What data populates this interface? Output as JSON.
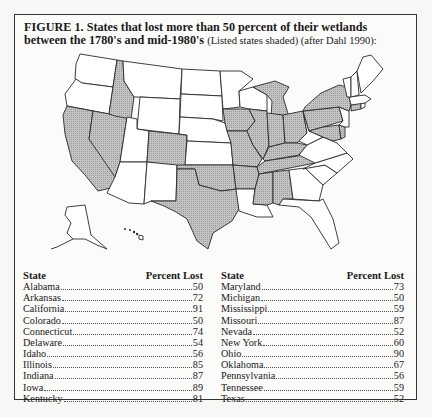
{
  "figure": {
    "caption_bold": "FIGURE 1. States that lost more than 50 percent of their wetlands between the 1780's and mid-1980's",
    "caption_note": "(Listed states shaded) (after Dahl 1990):"
  },
  "map": {
    "shade_color": "#b8b8b8",
    "shaded_states": [
      "Alabama",
      "Arkansas",
      "California",
      "Colorado",
      "Connecticut",
      "Delaware",
      "Idaho",
      "Illinois",
      "Indiana",
      "Iowa",
      "Kentucky",
      "Maryland",
      "Michigan",
      "Mississippi",
      "Missouri",
      "Nevada",
      "New York",
      "Ohio",
      "Oklahoma",
      "Pennsylvania",
      "Tennessee",
      "Texas"
    ]
  },
  "table": {
    "headers": {
      "state": "State",
      "percent": "Percent Lost"
    },
    "left": [
      {
        "state": "Alabama",
        "percent": "50"
      },
      {
        "state": "Arkansas",
        "percent": "72"
      },
      {
        "state": "California",
        "percent": "91"
      },
      {
        "state": "Colorado",
        "percent": "50"
      },
      {
        "state": "Connecticut",
        "percent": "74"
      },
      {
        "state": "Delaware",
        "percent": "54"
      },
      {
        "state": "Idaho",
        "percent": "56"
      },
      {
        "state": "Illinois",
        "percent": "85"
      },
      {
        "state": "Indiana",
        "percent": "87"
      },
      {
        "state": "Iowa",
        "percent": "89"
      },
      {
        "state": "Kentucky",
        "percent": "81"
      }
    ],
    "right": [
      {
        "state": "Maryland",
        "percent": "73"
      },
      {
        "state": "Michigan",
        "percent": "50"
      },
      {
        "state": "Mississippi",
        "percent": "59"
      },
      {
        "state": "Missouri",
        "percent": "87"
      },
      {
        "state": "Nevada",
        "percent": "52"
      },
      {
        "state": "New York",
        "percent": "60"
      },
      {
        "state": "Ohio",
        "percent": "90"
      },
      {
        "state": "Oklahoma",
        "percent": "67"
      },
      {
        "state": "Pennsylvania",
        "percent": "56"
      },
      {
        "state": "Tennessee",
        "percent": "59"
      },
      {
        "state": "Texas",
        "percent": "52"
      }
    ]
  }
}
